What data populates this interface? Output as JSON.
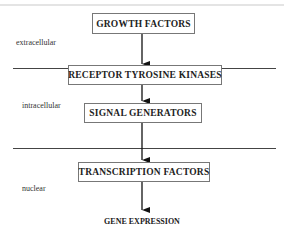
{
  "diagram": {
    "nodes": [
      {
        "id": "growth_factors",
        "label": "GROWTH FACTORS"
      },
      {
        "id": "receptor_tyrosine_kinases",
        "label": "RECEPTOR TYROSINE KINASES"
      },
      {
        "id": "signal_generators",
        "label": "SIGNAL GENERATORS"
      },
      {
        "id": "transcription_factors",
        "label": "TRANSCRIPTION FACTORS"
      },
      {
        "id": "gene_expression",
        "label": "GENE EXPRESSION"
      }
    ],
    "edges": [
      {
        "from": "growth_factors",
        "to": "receptor_tyrosine_kinases"
      },
      {
        "from": "receptor_tyrosine_kinases",
        "to": "signal_generators"
      },
      {
        "from": "signal_generators",
        "to": "transcription_factors"
      },
      {
        "from": "transcription_factors",
        "to": "gene_expression"
      }
    ],
    "regions": [
      {
        "id": "extracellular",
        "label": "extracellular"
      },
      {
        "id": "intracellular",
        "label": "intracellular"
      },
      {
        "id": "nuclear",
        "label": "nuclear"
      }
    ],
    "colors": {
      "line": "#444444",
      "box_border": "#777777",
      "text": "#222222"
    }
  }
}
